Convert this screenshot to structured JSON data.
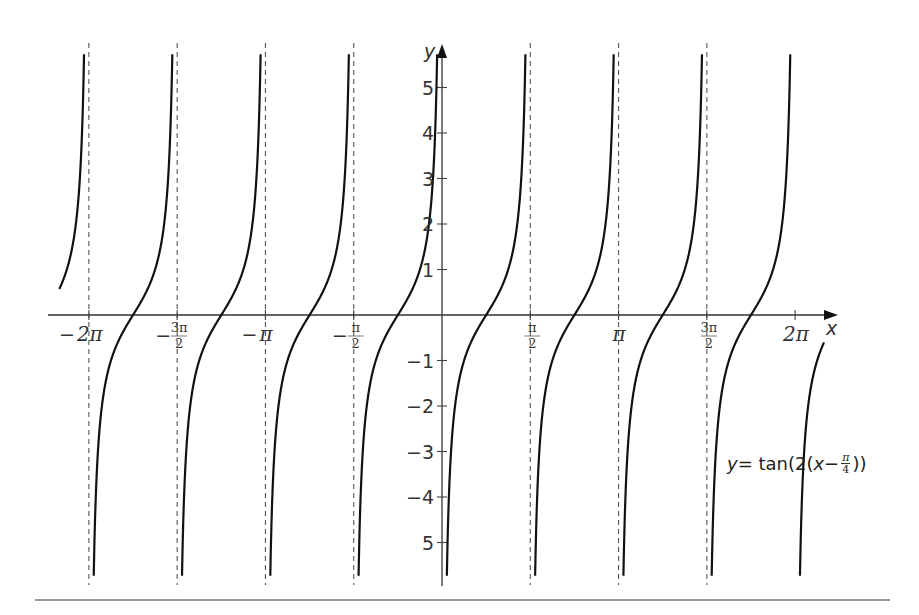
{
  "chart_data": {
    "type": "line",
    "title": "",
    "function": "y = tan(2(x - π/4))",
    "legend_label": "y = tan(2(x − π/4))",
    "xlabel": "x",
    "ylabel": "y",
    "xlim": [
      -6.81,
      6.8
    ],
    "ylim": [
      -6,
      6
    ],
    "grid": false,
    "x_ticks": [
      {
        "value": -6.2832,
        "label": "−2π",
        "kind": "plain",
        "text": "2π"
      },
      {
        "value": -4.7124,
        "label": "−3π/2",
        "kind": "frac",
        "num": "3π",
        "den": "2"
      },
      {
        "value": -3.1416,
        "label": "−π",
        "kind": "plain",
        "text": "π"
      },
      {
        "value": -1.5708,
        "label": "−π/2",
        "kind": "frac",
        "num": "π",
        "den": "2"
      },
      {
        "value": 1.5708,
        "label": "π/2",
        "kind": "frac",
        "num": "π",
        "den": "2"
      },
      {
        "value": 3.1416,
        "label": "π",
        "kind": "plain",
        "text": "π"
      },
      {
        "value": 4.7124,
        "label": "3π/2",
        "kind": "frac",
        "num": "3π",
        "den": "2"
      },
      {
        "value": 6.2832,
        "label": "2π",
        "kind": "plain",
        "text": "2π"
      }
    ],
    "y_ticks": [
      {
        "value": 5,
        "label": "5"
      },
      {
        "value": 4,
        "label": "4"
      },
      {
        "value": 3,
        "label": "3"
      },
      {
        "value": 2,
        "label": "2"
      },
      {
        "value": 1,
        "label": "1"
      },
      {
        "value": -1,
        "label": "−1"
      },
      {
        "value": -2,
        "label": "−2"
      },
      {
        "value": -3,
        "label": "−3"
      },
      {
        "value": -4,
        "label": "−4"
      },
      {
        "value": -5,
        "label": "5"
      }
    ],
    "asymptotes_dashed": [
      -6.2832,
      -4.7124,
      -3.1416,
      -1.5708,
      1.5708,
      3.1416,
      4.7124
    ],
    "zeros": [
      -5.4978,
      -3.927,
      -2.3562,
      -0.7854,
      0.7854,
      2.3562,
      3.927,
      5.4978
    ],
    "series": [
      {
        "name": "tan(2(x − π/4))",
        "period": 1.5708,
        "asymptotes_at": "kπ/2",
        "zeros_at": "π/4 + kπ/2"
      }
    ]
  },
  "labels": {
    "x_axis": "x",
    "y_axis": "y",
    "formula_y": "y",
    "formula_eq": " = tan(2(",
    "formula_x": "x",
    "formula_minus": " − ",
    "formula_num": "π",
    "formula_den": "4",
    "formula_close": "))"
  },
  "layout": {
    "origin_px": [
      442,
      315
    ],
    "px_per_unit_x": 56.2,
    "px_per_unit_y": 45.5,
    "x_axis_start_px": 48,
    "x_axis_end_px": 838,
    "y_axis_top_px": 44,
    "y_axis_bottom_px": 586,
    "curve_top_px": 43,
    "curve_bottom_px": 585
  }
}
